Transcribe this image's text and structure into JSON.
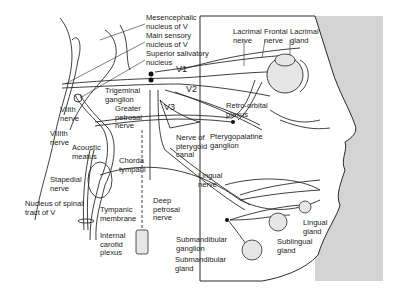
{
  "figure": {
    "background_panel_color": "#d4d4d4",
    "line_color": "#2a2a2a",
    "gland_fill": "#e6e6e6"
  },
  "branches": {
    "v1": "V1",
    "v2": "V2",
    "v3": "V3"
  },
  "labels": {
    "mesencephalic": "Mesencephalic\nnucleus of V",
    "main_sensory": "Main sensory\nnucleus of V",
    "superior_salivatory": "Superior salivatory\nnucleus",
    "lacrimal_nerve": "Lacrimal\nnerve",
    "frontal_nerve": "Frontal\nnerve",
    "lacrimal_gland": "Lacrimal\ngland",
    "trigeminal_ganglion": "Trigeminal\nganglion",
    "greater_petrosal": "Greater\npetrosal\nnerve",
    "viith_nerve": "VIIth\nnerve",
    "viiith_nerve": "VIIIth\nnerve",
    "acoustic_meatus": "Acoustic\nmeatus",
    "retro_orbital": "Retro-orbital\nplexus",
    "nerve_pterygoid": "Nerve of\npterygoid\ncanal",
    "pterygopalatine": "Pterygopalatine\nganglion",
    "chorda_tympani": "Chorda\ntympani",
    "stapedial": "Stapedial\nnerve",
    "lingual_nerve": "Lingual\nnerve",
    "spinal_tract": "Nucleus of spinal\ntract of V",
    "tympanic_membrane": "Tympanic\nmembrane",
    "deep_petrosal": "Deep\npetrosal\nnerve",
    "internal_carotid": "Internal\ncarotid\nplexus",
    "submandibular_ganglion": "Submandibular\nganglion",
    "submandibular_gland": "Submandibular\ngland",
    "sublingual_gland": "Sublingual\ngland",
    "lingual_gland": "Lingual\ngland"
  }
}
